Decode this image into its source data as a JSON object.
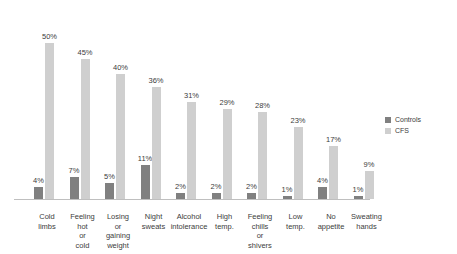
{
  "chart_data": {
    "type": "bar",
    "title": "",
    "subtitle": "",
    "xlabel": "",
    "ylabel": "",
    "ylim": [
      0,
      50
    ],
    "grid": false,
    "legend_position": "right",
    "categories": [
      "Cold limbs",
      "Feeling hot or cold",
      "Losing or gaining weight",
      "Night sweats",
      "Alcohol intolerance",
      "High temp.",
      "Feeling chills or shivers",
      "Low temp.",
      "No appetite",
      "Sweating hands"
    ],
    "series": [
      {
        "name": "Controls",
        "color": "#808080",
        "values": [
          4,
          7,
          5,
          11,
          2,
          2,
          2,
          1,
          4,
          1
        ],
        "labels": [
          "4%",
          "7%",
          "5%",
          "11%",
          "2%",
          "2%",
          "2%",
          "1%",
          "4%",
          "1%"
        ]
      },
      {
        "name": "CFS",
        "color": "#cfcfcf",
        "values": [
          50,
          45,
          40,
          36,
          31,
          29,
          28,
          23,
          17,
          9
        ],
        "labels": [
          "50%",
          "45%",
          "40%",
          "36%",
          "31%",
          "29%",
          "28%",
          "23%",
          "17%",
          "9%"
        ]
      }
    ]
  },
  "legend": {
    "items": [
      {
        "label": "Controls"
      },
      {
        "label": "CFS"
      }
    ]
  }
}
